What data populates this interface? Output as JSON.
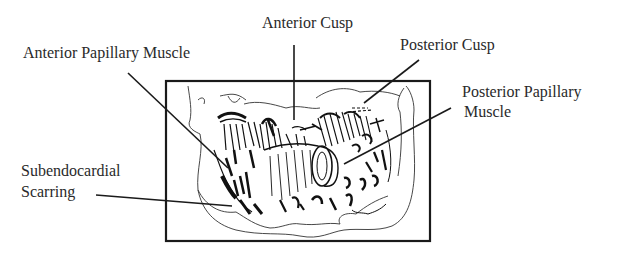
{
  "labels": {
    "anterior_cusp": "Anterior Cusp",
    "posterior_cusp": "Posterior Cusp",
    "anterior_papillary_muscle": "Anterior Papillary Muscle",
    "posterior_papillary_muscle_line1": "Posterior Papillary",
    "posterior_papillary_muscle_line2": "Muscle",
    "subendocardial_scarring_line1": "Subendocardial",
    "subendocardial_scarring_line2": "Scarring"
  },
  "colors": {
    "ink": "#1a1a1a",
    "text": "#2a2a2a",
    "background": "#ffffff"
  }
}
